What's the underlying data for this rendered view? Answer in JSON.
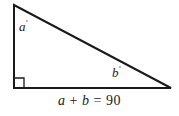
{
  "figure": {
    "type": "right-triangle-angle-sum",
    "stroke_color": "#1a1a1a",
    "background_color": "#ffffff",
    "labels": {
      "angle_a": "a",
      "angle_a_unit": "˚",
      "angle_b": "b",
      "angle_b_unit": "˚"
    },
    "equation": {
      "left_term": "a",
      "operator": "+",
      "right_term": "b",
      "equals": "=",
      "value": "90",
      "full_text": "a + b = 90"
    },
    "geometry": {
      "apex": [
        14,
        5
      ],
      "right_angle_vertex": [
        14,
        88
      ],
      "acute_vertex": [
        171,
        88
      ],
      "right_angle_marker_size": 10
    }
  }
}
